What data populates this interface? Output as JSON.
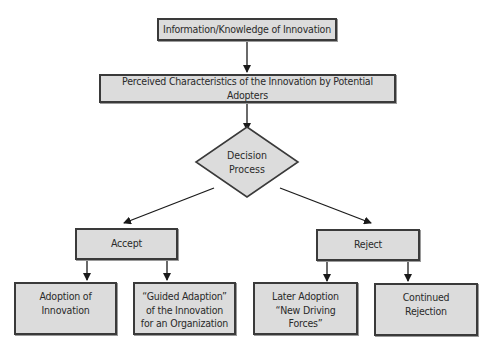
{
  "diagram": {
    "type": "flowchart",
    "nodes": {
      "info": {
        "label": "Information/Knowledge of Innovation"
      },
      "perceived": {
        "label": "Perceived Characteristics of the Innovation by Potential Adopters"
      },
      "decision": {
        "label": "Decision Process",
        "shape": "diamond"
      },
      "accept": {
        "label": "Accept"
      },
      "reject": {
        "label": "Reject"
      },
      "adoption": {
        "label": "Adoption of Innovation"
      },
      "guided": {
        "label": "“Guided Adaption” of the Innovation for an Organization"
      },
      "later": {
        "label": "Later Adoption “New Driving Forces”"
      },
      "continued": {
        "label": "Continued Rejection"
      }
    },
    "edges": [
      {
        "from": "info",
        "to": "perceived"
      },
      {
        "from": "perceived",
        "to": "decision"
      },
      {
        "from": "decision",
        "to": "accept"
      },
      {
        "from": "decision",
        "to": "reject"
      },
      {
        "from": "accept",
        "to": "adoption"
      },
      {
        "from": "accept",
        "to": "guided"
      },
      {
        "from": "reject",
        "to": "later"
      },
      {
        "from": "reject",
        "to": "continued"
      }
    ],
    "colors": {
      "box_fill": "#dcdcdc",
      "box_border": "#3a3a3a",
      "line": "#1a1a1a",
      "text": "#2a2a2a"
    }
  }
}
